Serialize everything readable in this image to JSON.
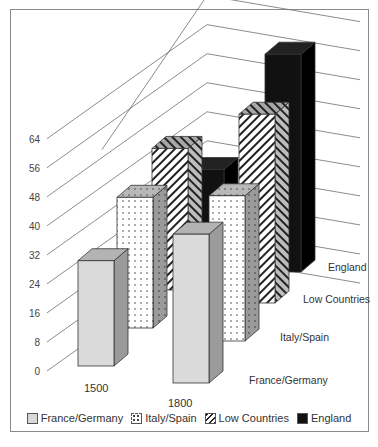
{
  "chart_data": {
    "type": "bar",
    "subtype": "3d-clustered-column",
    "title": "",
    "xlabel": "",
    "ylabel": "",
    "categories": [
      "1500",
      "1800"
    ],
    "series": [
      {
        "name": "France/Germany",
        "values": [
          29,
          41
        ],
        "pattern": "solid-light-gray",
        "color": "#d9d9d9"
      },
      {
        "name": "Italy/Spain",
        "values": [
          36,
          40
        ],
        "pattern": "dots",
        "color": "#ffffff"
      },
      {
        "name": "Low Countries",
        "values": [
          39,
          52
        ],
        "pattern": "diagonal-stripes",
        "color": "#ffffff"
      },
      {
        "name": "England",
        "values": [
          23,
          60
        ],
        "pattern": "solid-black",
        "color": "#111111"
      }
    ],
    "yticks": [
      "0",
      "8",
      "16",
      "24",
      "32",
      "40",
      "48",
      "56",
      "64"
    ],
    "ylim": [
      0,
      64
    ],
    "grid": true,
    "legend_position": "bottom",
    "depth_axis_labels": [
      "France/Germany",
      "Italy/Spain",
      "Low Countries",
      "England"
    ]
  },
  "legend": {
    "items": [
      {
        "label": "France/Germany",
        "swatch": "light-gray"
      },
      {
        "label": "Italy/Spain",
        "swatch": "dots"
      },
      {
        "label": "Low Countries",
        "swatch": "stripes"
      },
      {
        "label": "England",
        "swatch": "black"
      }
    ]
  }
}
